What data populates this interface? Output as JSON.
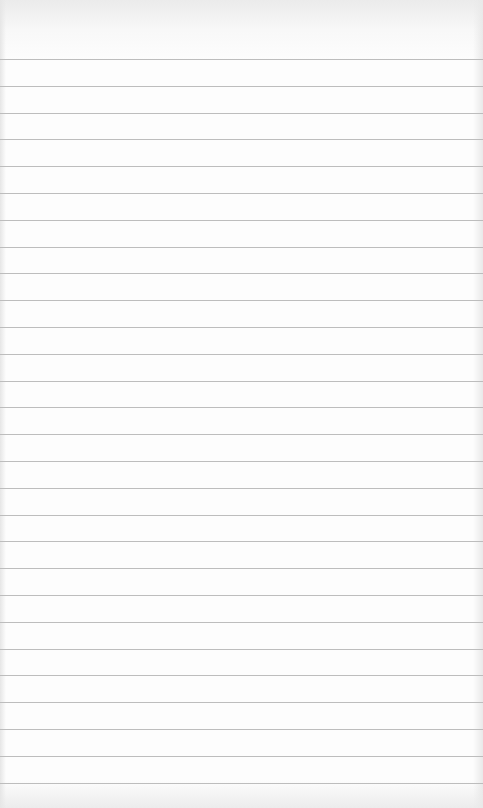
{
  "paper": {
    "type": "lined-notepad",
    "line_color": "#bdbdbd",
    "background_color": "#fdfdfd",
    "first_line_y": 59,
    "line_spacing": 26.8,
    "line_count": 28
  }
}
